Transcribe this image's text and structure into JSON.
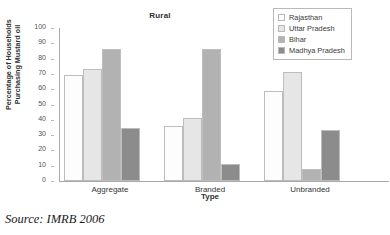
{
  "chart_data": {
    "type": "bar",
    "title": "Rural",
    "xlabel": "Type",
    "ylabel_line1": "Percentage of Households",
    "ylabel_line2": "Purchasing Mustard oil",
    "categories": [
      "Aggregate",
      "Branded",
      "Unbranded"
    ],
    "series": [
      {
        "name": "Rajasthan",
        "color": "#fdfdfd",
        "values": [
          69,
          36,
          59
        ]
      },
      {
        "name": "Uttar Pradesh",
        "color": "#e6e6e6",
        "values": [
          73,
          41,
          71
        ]
      },
      {
        "name": "Bihar",
        "color": "#b2b2b2",
        "values": [
          86.5,
          86.5,
          8
        ]
      },
      {
        "name": "Madhya Pradesh",
        "color": "#8c8c8c",
        "values": [
          34.5,
          11,
          33.5
        ]
      }
    ],
    "ylim": [
      0,
      100
    ],
    "yticks": [
      0,
      10,
      20,
      30,
      40,
      50,
      60,
      70,
      80,
      90,
      100
    ],
    "grid": false,
    "legend_position": "top-right"
  },
  "caption": {
    "source": "Source: IMRB 2006"
  }
}
